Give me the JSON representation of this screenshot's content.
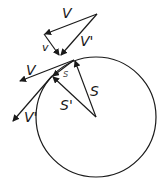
{
  "diagram": {
    "stroke_color": "#1a1a1a",
    "circle": {
      "cx": 96,
      "cy": 117,
      "r": 60
    },
    "triangle": {
      "labels": {
        "V": "V",
        "v": "v",
        "V_prime": "V'"
      }
    },
    "orbit": {
      "labels": {
        "V": "V",
        "s": "s",
        "S": "S",
        "S_prime": "S'",
        "V_prime": "V'"
      }
    }
  }
}
